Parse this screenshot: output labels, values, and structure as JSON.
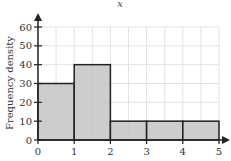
{
  "chart_data": {
    "type": "bar",
    "subtype": "histogram",
    "title": "x",
    "xlabel": "",
    "ylabel": "Frequency density",
    "xlim": [
      0,
      5
    ],
    "ylim": [
      0,
      60
    ],
    "x_ticks": [
      "0",
      "1",
      "2",
      "3",
      "4",
      "5"
    ],
    "y_ticks": [
      "0",
      "10",
      "20",
      "30",
      "40",
      "50",
      "60"
    ],
    "grid": true,
    "bins": [
      {
        "from": 0,
        "to": 1,
        "value": 30
      },
      {
        "from": 1,
        "to": 2,
        "value": 40
      },
      {
        "from": 2,
        "to": 3,
        "value": 10
      },
      {
        "from": 3,
        "to": 4,
        "value": 10
      },
      {
        "from": 4,
        "to": 5,
        "value": 10
      }
    ],
    "categories": [
      "0-1",
      "1-2",
      "2-3",
      "3-4",
      "4-5"
    ],
    "values": [
      30,
      40,
      10,
      10,
      10
    ],
    "colors": {
      "bar_fill": "#c4c4c4",
      "bar_edge": "#222222",
      "grid": "#e2e2e2"
    }
  }
}
